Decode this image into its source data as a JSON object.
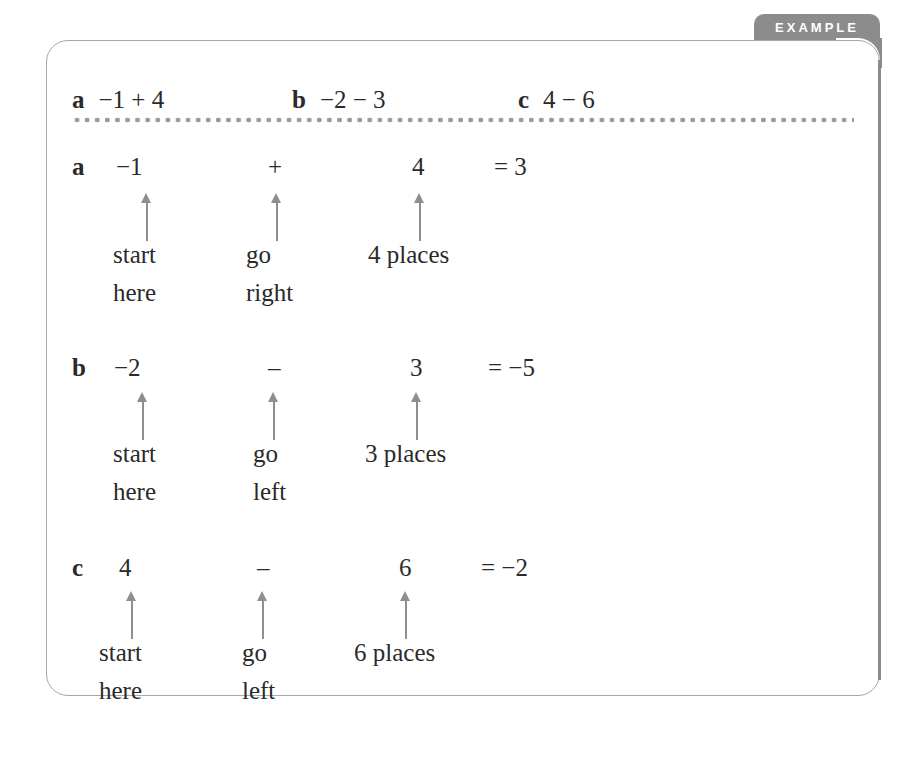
{
  "badge": {
    "label": "EXAMPLE"
  },
  "questions": [
    {
      "letter": "a",
      "expr": "−1 + 4"
    },
    {
      "letter": "b",
      "expr": "−2 − 3"
    },
    {
      "letter": "c",
      "expr": "4 − 6"
    }
  ],
  "solutions": [
    {
      "letter": "a",
      "start": "−1",
      "op": "+",
      "amount": "4",
      "result": "= 3",
      "start_label": [
        "start",
        "here"
      ],
      "op_label": [
        "go",
        "right"
      ],
      "amount_label": "4 places"
    },
    {
      "letter": "b",
      "start": "−2",
      "op": "–",
      "amount": "3",
      "result": "= −5",
      "start_label": [
        "start",
        "here"
      ],
      "op_label": [
        "go",
        "left"
      ],
      "amount_label": "3 places"
    },
    {
      "letter": "c",
      "start": "4",
      "op": "–",
      "amount": "6",
      "result": "= −2",
      "start_label": [
        "start",
        "here"
      ],
      "op_label": [
        "go",
        "left"
      ],
      "amount_label": "6 places"
    }
  ],
  "colors": {
    "badge": "#8c8c8c",
    "border": "#a8a8a8",
    "arrow": "#8e8e8e",
    "dots": "#9a9a9a"
  }
}
